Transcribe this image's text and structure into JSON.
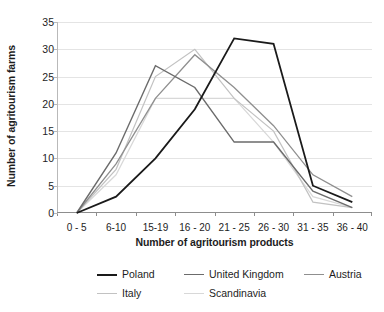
{
  "chart_data": {
    "type": "line",
    "title": "",
    "xlabel": "Number of agritourism products",
    "ylabel": "Number of agritourism farms",
    "categories": [
      "0 - 5",
      "6-10",
      "15-19",
      "16 - 20",
      "21 - 25",
      "26 - 30",
      "31 - 35",
      "36 - 40"
    ],
    "ylim": [
      0,
      35
    ],
    "yticks": [
      0,
      5,
      10,
      15,
      20,
      25,
      30,
      35
    ],
    "grid": "horizontal",
    "legend_position": "bottom",
    "series": [
      {
        "name": "Poland",
        "color": "#1a1a1a",
        "width": 1.8,
        "values": [
          0,
          3,
          10,
          19,
          32,
          31,
          5,
          2
        ]
      },
      {
        "name": "United Kingdom",
        "color": "#6b6b6b",
        "width": 1.4,
        "values": [
          0,
          11,
          27,
          23,
          13,
          13,
          4,
          1
        ]
      },
      {
        "name": "Austria",
        "color": "#8f8f8f",
        "width": 1.3,
        "values": [
          0,
          9,
          21,
          29,
          23,
          16,
          7,
          3
        ]
      },
      {
        "name": "Italy",
        "color": "#c2c2c2",
        "width": 1.2,
        "values": [
          0,
          8,
          25,
          30,
          21,
          15,
          2,
          1
        ]
      },
      {
        "name": "Scandinavia",
        "color": "#d8d8d8",
        "width": 1.2,
        "values": [
          0,
          7,
          21,
          21,
          21,
          13,
          3,
          1
        ]
      }
    ]
  },
  "legend": {
    "rows": [
      [
        {
          "label": "Poland",
          "color": "#1a1a1a",
          "width": 2.2,
          "x": 35
        },
        {
          "label": "United Kingdom",
          "color": "#6b6b6b",
          "width": 1.6,
          "x": 122
        },
        {
          "label": "Austria",
          "color": "#8f8f8f",
          "width": 1.4,
          "x": 242
        }
      ],
      [
        {
          "label": "Italy",
          "color": "#c2c2c2",
          "width": 1.3,
          "x": 35
        },
        {
          "label": "Scandinavia",
          "color": "#d8d8d8",
          "width": 1.3,
          "x": 122
        }
      ]
    ]
  }
}
